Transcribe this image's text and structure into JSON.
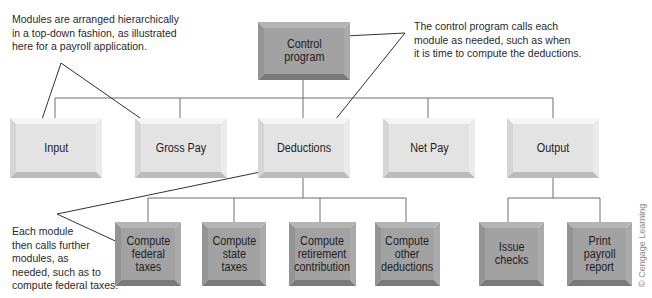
{
  "diagram": {
    "type": "hierarchy-chart",
    "colors": {
      "light_face": "#e3e3e3",
      "dark_face": "#a2a2a2",
      "connector": "#6e6e6e",
      "callout": "#333333",
      "text": "#1e1e1e"
    },
    "nodes": {
      "control": {
        "label": "Control\nprogram",
        "tone": "dark"
      },
      "input": {
        "label": "Input",
        "tone": "light"
      },
      "gross_pay": {
        "label": "Gross Pay",
        "tone": "light"
      },
      "deductions": {
        "label": "Deductions",
        "tone": "light"
      },
      "net_pay": {
        "label": "Net Pay",
        "tone": "light"
      },
      "output": {
        "label": "Output",
        "tone": "light"
      },
      "federal": {
        "label": "Compute\nfederal\ntaxes",
        "tone": "dark"
      },
      "state": {
        "label": "Compute\nstate\ntaxes",
        "tone": "dark"
      },
      "retirement": {
        "label": "Compute\nretirement\ncontribution",
        "tone": "dark"
      },
      "other": {
        "label": "Compute\nother\ndeductions",
        "tone": "dark"
      },
      "issue": {
        "label": "Issue\nchecks",
        "tone": "dark"
      },
      "print": {
        "label": "Print\npayroll\nreport",
        "tone": "dark"
      }
    },
    "edges": [
      [
        "control",
        "input"
      ],
      [
        "control",
        "gross_pay"
      ],
      [
        "control",
        "deductions"
      ],
      [
        "control",
        "net_pay"
      ],
      [
        "control",
        "output"
      ],
      [
        "deductions",
        "federal"
      ],
      [
        "deductions",
        "state"
      ],
      [
        "deductions",
        "retirement"
      ],
      [
        "deductions",
        "other"
      ],
      [
        "output",
        "issue"
      ],
      [
        "output",
        "print"
      ]
    ],
    "annotations": {
      "top_left": "Modules are arranged hierarchically\nin a top-down fashion, as illustrated\nhere for a payroll application.",
      "top_right": "The control program calls each\nmodule as needed, such as when\nit is time to compute the deductions.",
      "bottom_left": "Each module\nthen calls further\nmodules, as\nneeded, such as to\ncompute federal taxes."
    },
    "credit": "© Cengage Learning"
  }
}
